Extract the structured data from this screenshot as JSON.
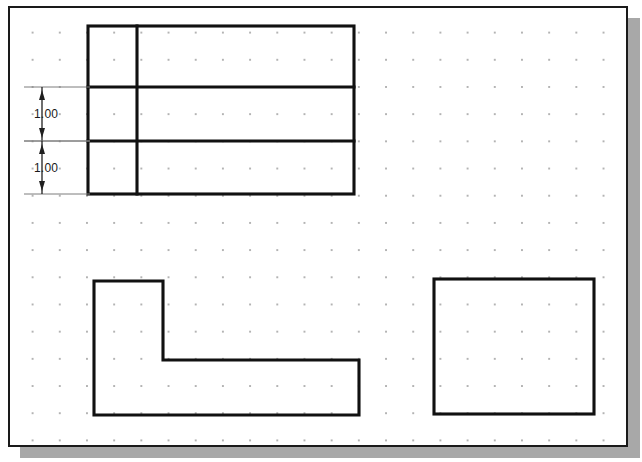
{
  "canvas": {
    "width": 642,
    "height": 462,
    "background": "#ffffff",
    "sheet_background": "#ffffff",
    "border_color": "#1a1a1a",
    "shadow_color": "#a8a8a8",
    "grid": {
      "visible": true,
      "dot_color": "#9a9a9a",
      "spacing_px": 27.2
    }
  },
  "drawing": {
    "title": "Orthographic views with grid snap",
    "line_color": "#111111",
    "dimension_color": "#1f1f1f",
    "extension_color": "#7d7d7d",
    "views": [
      {
        "name": "top-view-subdivided-rectangle",
        "type": "rectangle-with-internal-divisions",
        "x": 86,
        "y": 24,
        "width": 266,
        "height": 168,
        "vertical_dividers": [
          135
        ],
        "horizontal_dividers": [
          85,
          139
        ]
      },
      {
        "name": "front-view-l-shape",
        "type": "polygon",
        "points": "92,279 161,279 161,358 357,358 357,413 92,413"
      },
      {
        "name": "side-view-rectangle",
        "type": "rectangle",
        "x": 432,
        "y": 277,
        "width": 160,
        "height": 135
      }
    ],
    "dimensions": [
      {
        "name": "dimension-upper",
        "label": "1.00",
        "orientation": "vertical",
        "x": 40,
        "y_top": 85,
        "y_bottom": 139,
        "text_x": 28,
        "text_y": 105,
        "extension_x_start": 22,
        "extension_x_end": 88
      },
      {
        "name": "dimension-lower",
        "label": "1.00",
        "orientation": "vertical",
        "x": 40,
        "y_top": 139,
        "y_bottom": 192,
        "text_x": 28,
        "text_y": 159,
        "extension_x_start": 22,
        "extension_x_end": 88
      }
    ]
  }
}
